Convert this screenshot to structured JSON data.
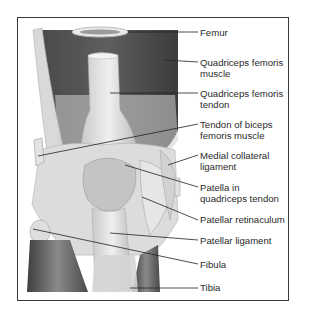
{
  "figure": {
    "labels": [
      {
        "id": "femur",
        "text": "Femur"
      },
      {
        "id": "quadriceps-femoris-muscle",
        "text": "Quadriceps femoris\nmuscle"
      },
      {
        "id": "quadriceps-femoris-tendon",
        "text": "Quadriceps femoris\ntendon"
      },
      {
        "id": "tendon-of-biceps-femoris-muscle",
        "text": "Tendon of biceps\nfemoris muscle"
      },
      {
        "id": "medial-collateral-ligament",
        "text": "Medial collateral\nligament"
      },
      {
        "id": "patella-in-quadriceps-tendon",
        "text": "Patella in\nquadriceps tendon"
      },
      {
        "id": "patellar-retinaculum",
        "text": "Patellar retinaculum"
      },
      {
        "id": "patellar-ligament",
        "text": "Patellar ligament"
      },
      {
        "id": "fibula",
        "text": "Fibula"
      },
      {
        "id": "tibia",
        "text": "Tibia"
      }
    ]
  }
}
